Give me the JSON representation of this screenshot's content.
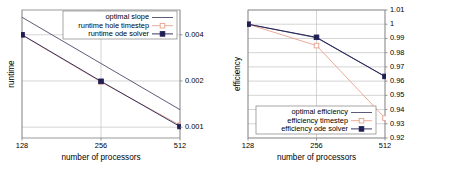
{
  "figure": {
    "panels": [
      "runtime",
      "efficiency"
    ],
    "background": "#ffffff"
  },
  "colors": {
    "optimal": "#4a4a6a",
    "timestep": "#e8a08c",
    "ode_solver": "#1f1f55",
    "grid": "#b8b8b8",
    "frame": "#808080",
    "text": "#000000"
  },
  "chart_data": [
    {
      "id": "runtime",
      "type": "line",
      "title": "",
      "xlabel": "number of processors",
      "ylabel": "runtime",
      "xscale": "log2",
      "yscale": "log",
      "x": [
        128,
        256,
        512
      ],
      "xticklabels": [
        "128",
        "256",
        "512"
      ],
      "xlim": [
        128,
        512
      ],
      "ylim": [
        0.00085,
        0.0058
      ],
      "yticks": [
        0.001,
        0.002,
        0.004
      ],
      "yticklabels": [
        "0.001",
        "0.002",
        "0.004"
      ],
      "ytick_side": "right",
      "grid": true,
      "legend_position": "top-right",
      "series": [
        {
          "name": "optimal slope",
          "key": "optimal",
          "marker": "none",
          "color": "#4a4a6a",
          "values": [
            0.0052,
            0.0026,
            0.0013
          ]
        },
        {
          "name": "runtime hole timestep",
          "key": "timestep",
          "marker": "open-square",
          "color": "#e8a08c",
          "values": [
            0.00398,
            0.00197,
            0.00103
          ]
        },
        {
          "name": "runtime ode solver",
          "key": "ode_solver",
          "marker": "filled-square",
          "color": "#1f1f55",
          "values": [
            0.004,
            0.00199,
            0.00101
          ]
        }
      ]
    },
    {
      "id": "efficiency",
      "type": "line",
      "title": "",
      "xlabel": "number of processors",
      "ylabel": "efficiency",
      "xscale": "log2",
      "yscale": "linear",
      "x": [
        128,
        256,
        512
      ],
      "xticklabels": [
        "128",
        "256",
        "512"
      ],
      "xlim": [
        128,
        512
      ],
      "ylim": [
        0.92,
        1.01
      ],
      "yticks": [
        0.92,
        0.93,
        0.94,
        0.95,
        0.96,
        0.97,
        0.98,
        0.99,
        1.0,
        1.01
      ],
      "yticklabels": [
        "0.92",
        "0.93",
        "0.94",
        "0.95",
        "0.96",
        "0.97",
        "0.98",
        "0.99",
        "1",
        "1.01"
      ],
      "ytick_side": "right",
      "grid": true,
      "legend_position": "bottom-center",
      "series": [
        {
          "name": "optimal efficiency",
          "key": "optimal",
          "marker": "none",
          "color": "#4a4a6a",
          "values": [
            1.0,
            0.9905,
            0.9632
          ]
        },
        {
          "name": "efficiency timestep",
          "key": "timestep",
          "marker": "open-square",
          "color": "#e8a08c",
          "values": [
            1.0,
            0.985,
            0.934
          ]
        },
        {
          "name": "efficiency ode solver",
          "key": "ode_solver",
          "marker": "filled-square",
          "color": "#1f1f55",
          "values": [
            1.0,
            0.9908,
            0.9633
          ]
        }
      ]
    }
  ]
}
